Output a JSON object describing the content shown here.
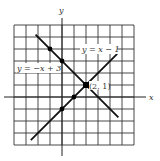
{
  "chart_data": {
    "type": "line",
    "title": "",
    "xlabel": "x",
    "ylabel": "y",
    "xlim": [
      -4,
      6
    ],
    "ylim": [
      -4,
      6
    ],
    "grid": true,
    "grid_step": 1,
    "series": [
      {
        "name": "y = -x + 3",
        "equation": "y = -x + 3",
        "x": [
          -2.2,
          4.7
        ],
        "y": [
          5.2,
          -1.7
        ],
        "marked_points": [
          [
            -1,
            4
          ],
          [
            0,
            3
          ],
          [
            2,
            1
          ]
        ]
      },
      {
        "name": "y = x - 1",
        "equation": "y = x - 1",
        "x": [
          -2.6,
          4.6
        ],
        "y": [
          -3.6,
          3.6
        ],
        "marked_points": [
          [
            0,
            -1
          ],
          [
            1,
            0
          ],
          [
            2,
            1
          ]
        ]
      }
    ],
    "annotations": [
      {
        "text": "(2, 1)",
        "x": 2,
        "y": 1,
        "note": "intersection point"
      }
    ],
    "labels": {
      "line1": "y = −x + 3",
      "line2": "y = x − 1",
      "intersection": "(2, 1)",
      "x_axis": "x",
      "y_axis": "y"
    }
  },
  "colors": {
    "grid": "#333333",
    "line": "#111111",
    "background": "#ffffff"
  }
}
